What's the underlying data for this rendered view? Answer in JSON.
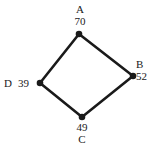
{
  "diagram": {
    "type": "node-link-quadrilateral",
    "background_color": "#ffffff",
    "edge_color": "#1a1a1a",
    "node_color": "#1a1a1a",
    "nodes": [
      {
        "id": "A",
        "label": "A",
        "value": "70",
        "x": 79,
        "y": 34,
        "label_position": "above"
      },
      {
        "id": "B",
        "label": "B",
        "value": "52",
        "x": 133,
        "y": 76,
        "label_position": "right"
      },
      {
        "id": "C",
        "label": "C",
        "value": "49",
        "x": 82,
        "y": 117,
        "label_position": "below"
      },
      {
        "id": "D",
        "label": "D",
        "value": "39",
        "x": 40,
        "y": 83,
        "label_position": "left"
      }
    ],
    "edges": [
      {
        "from": "A",
        "to": "B"
      },
      {
        "from": "B",
        "to": "C"
      },
      {
        "from": "C",
        "to": "D"
      },
      {
        "from": "D",
        "to": "A"
      }
    ]
  }
}
